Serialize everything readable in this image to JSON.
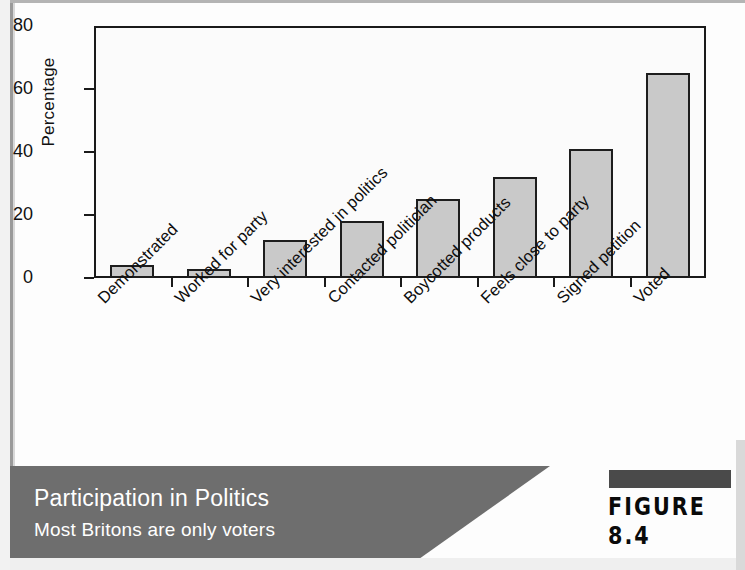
{
  "figure": {
    "label": "FIGURE 8.4",
    "caption_title": "Participation in Politics",
    "caption_subtitle": "Most Britons are only voters",
    "caption_band_color": "#6e6e6e",
    "caption_text_color": "#ffffff",
    "figure_bar_color": "#4a4a4a"
  },
  "chart_data": {
    "type": "bar",
    "title": "Participation in Politics",
    "subtitle": "Most Britons are only voters",
    "xlabel": "",
    "ylabel": "Percentage",
    "ylim": [
      0,
      80
    ],
    "yticks": [
      0,
      20,
      40,
      60,
      80
    ],
    "ytick_labels": [
      "0",
      "20",
      "40",
      "60",
      "80"
    ],
    "grid": false,
    "legend": false,
    "bar_fill_color": "#c9c9c9",
    "bar_edge_color": "#1d1d1d",
    "categories": [
      "Demonstrated",
      "Worked for party",
      "Very interested in politics",
      "Contacted politician",
      "Boycotted products",
      "Feels close to party",
      "Signed petition",
      "Voted"
    ],
    "values": [
      4,
      3,
      12,
      18,
      25,
      32,
      41,
      65
    ]
  }
}
